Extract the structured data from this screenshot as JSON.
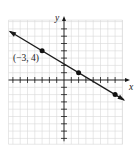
{
  "chart_data": {
    "type": "line",
    "title": "",
    "xlabel": "x",
    "ylabel": "y",
    "xlim": [
      -7.6,
      8
    ],
    "ylim": [
      -8.8,
      8.2
    ],
    "grid": true,
    "x_ticks": [
      -7,
      -6,
      -5,
      -4,
      -3,
      -2,
      -1,
      1,
      2,
      3,
      4,
      5,
      6,
      7
    ],
    "y_ticks": [
      -8,
      -7,
      -6,
      -5,
      -4,
      -3,
      -2,
      -1,
      1,
      2,
      3,
      4,
      5,
      6,
      7
    ],
    "series": [
      {
        "name": "line",
        "equation": "y = -3/5 x + 11/5",
        "slope": -0.6,
        "intercept": 2.2,
        "x": [
          -7.4,
          8.2
        ],
        "y": [
          6.64,
          -2.72
        ],
        "arrows": "both"
      }
    ],
    "points": [
      {
        "x": -3,
        "y": 4,
        "label": "(−3, 4)"
      },
      {
        "x": 2,
        "y": 1,
        "label": ""
      },
      {
        "x": 7,
        "y": -2,
        "label": ""
      }
    ],
    "annotations": [
      "(−3, 4)"
    ]
  },
  "labels": {
    "x_axis": "x",
    "y_axis": "y",
    "point_label": "(−3, 4)"
  }
}
